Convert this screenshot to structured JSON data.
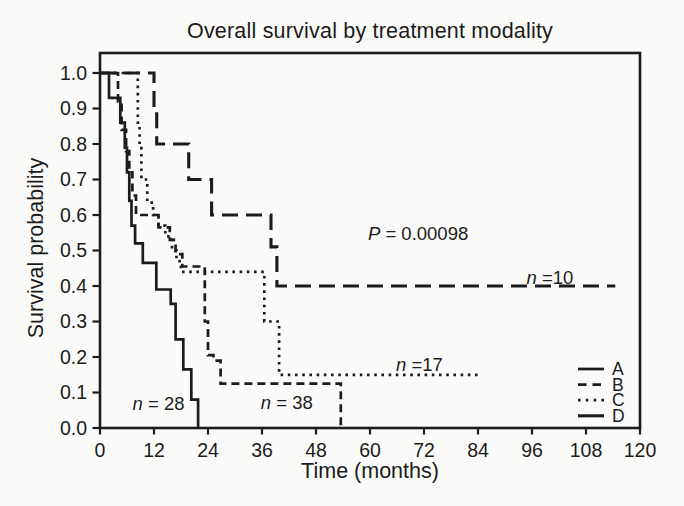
{
  "figure": {
    "background": "#fafaf8",
    "ink": "#1c1c1c"
  },
  "chart_data": {
    "type": "line",
    "subtype": "kaplan-meier-step",
    "title": "Overall survival by treatment modality",
    "xlabel": "Time (months)",
    "ylabel": "Survival probability",
    "xlim": [
      0,
      120
    ],
    "ylim": [
      0.0,
      1.0
    ],
    "x_ticks": [
      0,
      12,
      24,
      36,
      48,
      60,
      72,
      84,
      96,
      108,
      120
    ],
    "y_ticks": [
      1.0,
      0.9,
      0.8,
      0.7,
      0.6,
      0.5,
      0.4,
      0.3,
      0.2,
      0.1,
      0.0
    ],
    "grid": false,
    "legend_position": "lower right",
    "p_value": 0.00098,
    "series": [
      {
        "name": "B",
        "n": 38,
        "linestyle": "dashed",
        "end": 53.5,
        "steps": [
          [
            0,
            1.0
          ],
          [
            4,
            0.92
          ],
          [
            4.8,
            0.84
          ],
          [
            5.8,
            0.78
          ],
          [
            6.5,
            0.72
          ],
          [
            7.2,
            0.655
          ],
          [
            8,
            0.6
          ],
          [
            13,
            0.565
          ],
          [
            15.5,
            0.53
          ],
          [
            16.8,
            0.49
          ],
          [
            18.3,
            0.455
          ],
          [
            23.3,
            0.3
          ],
          [
            24,
            0.205
          ],
          [
            25.2,
            0.19
          ],
          [
            26.8,
            0.125
          ],
          [
            53.5,
            0.0
          ]
        ]
      },
      {
        "name": "C",
        "n": 17,
        "linestyle": "dotted",
        "end": 84,
        "steps": [
          [
            0,
            1.0
          ],
          [
            8.4,
            0.86
          ],
          [
            8.8,
            0.8
          ],
          [
            9.2,
            0.7
          ],
          [
            10.5,
            0.635
          ],
          [
            11.8,
            0.6
          ],
          [
            13,
            0.57
          ],
          [
            14.5,
            0.54
          ],
          [
            16,
            0.5
          ],
          [
            17,
            0.47
          ],
          [
            18,
            0.44
          ],
          [
            36.5,
            0.3
          ],
          [
            39.8,
            0.15
          ]
        ]
      },
      {
        "name": "A",
        "n": 28,
        "linestyle": "solid",
        "end": 21.8,
        "steps": [
          [
            0,
            1.0
          ],
          [
            2,
            0.93
          ],
          [
            4.5,
            0.86
          ],
          [
            5.5,
            0.79
          ],
          [
            6,
            0.72
          ],
          [
            6.5,
            0.64
          ],
          [
            7,
            0.57
          ],
          [
            7.8,
            0.52
          ],
          [
            9.5,
            0.465
          ],
          [
            12.5,
            0.39
          ],
          [
            15.7,
            0.35
          ],
          [
            16.8,
            0.25
          ],
          [
            18.5,
            0.165
          ],
          [
            20.3,
            0.08
          ],
          [
            21.8,
            0.0
          ]
        ]
      },
      {
        "name": "D",
        "n": 10,
        "linestyle": "longdash",
        "end": 114.5,
        "steps": [
          [
            0,
            1.0
          ],
          [
            12,
            0.9
          ],
          [
            12.6,
            0.8
          ],
          [
            19.7,
            0.7
          ],
          [
            24.8,
            0.6
          ],
          [
            38,
            0.51
          ],
          [
            39.3,
            0.4
          ]
        ]
      }
    ],
    "legend_order": [
      "A",
      "B",
      "C",
      "D"
    ],
    "annotations": [
      {
        "id": "p-value",
        "italic": "P",
        "rest": " = 0.00098",
        "t": 70.7,
        "p": 0.53
      },
      {
        "id": "n-D",
        "series": "D",
        "italic": "n",
        "rest": " =10",
        "t": 100,
        "p": 0.405
      },
      {
        "id": "n-C",
        "series": "C",
        "italic": "n",
        "rest": " =17",
        "t": 71,
        "p": 0.16
      },
      {
        "id": "n-B",
        "series": "B",
        "italic": "n",
        "rest": " = 38",
        "t": 41.5,
        "p": 0.053
      },
      {
        "id": "n-A",
        "series": "A",
        "italic": "n",
        "rest": " = 28",
        "t": 13,
        "p": 0.05
      }
    ]
  }
}
